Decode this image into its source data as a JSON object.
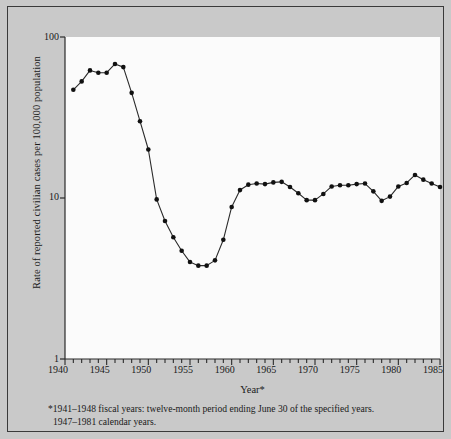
{
  "chart_data": {
    "type": "line",
    "title": "",
    "xlabel": "Year*",
    "ylabel": "Rate of reported civilian cases per 100,000 population",
    "yscale": "log",
    "ylim": [
      1,
      100
    ],
    "xlim": [
      1940,
      1985
    ],
    "grid": false,
    "legend": null,
    "marker": "filled-circle",
    "x": [
      1941,
      1942,
      1943,
      1944,
      1945,
      1946,
      1947,
      1948,
      1949,
      1950,
      1951,
      1952,
      1953,
      1954,
      1955,
      1956,
      1957,
      1958,
      1959,
      1960,
      1961,
      1962,
      1963,
      1964,
      1965,
      1966,
      1967,
      1968,
      1969,
      1970,
      1971,
      1972,
      1973,
      1974,
      1975,
      1976,
      1977,
      1978,
      1979,
      1980,
      1981,
      1982,
      1983,
      1984,
      1985
    ],
    "values": [
      47,
      53,
      62,
      60,
      60,
      68,
      65,
      45,
      30,
      20,
      9.8,
      7.2,
      5.7,
      4.7,
      4.0,
      3.8,
      3.8,
      4.1,
      5.5,
      8.8,
      11.2,
      12.1,
      12.3,
      12.2,
      12.5,
      12.6,
      11.7,
      10.7,
      9.7,
      9.7,
      10.6,
      11.8,
      12.0,
      12.0,
      12.2,
      12.3,
      11.0,
      9.6,
      10.2,
      11.8,
      12.4,
      13.9,
      13.0,
      12.3,
      11.7
    ],
    "xticks": [
      1940,
      1945,
      1950,
      1955,
      1960,
      1965,
      1970,
      1975,
      1980,
      1985
    ],
    "xtick_labels": [
      "1940",
      "1945",
      "1950",
      "1955",
      "1960",
      "1965",
      "1970",
      "1975",
      "1980",
      "1985"
    ],
    "yticks": [
      1,
      10,
      100
    ],
    "ytick_labels": [
      "1",
      "10",
      "100"
    ],
    "minor_xticks_step": 1,
    "line_color": "#2a2a2a",
    "marker_color": "#111111",
    "plot_background": "#fbfbfb",
    "figure_background": "#c9c9c9"
  },
  "footnote": {
    "line1": "*1941–1948 fiscal years:  twelve-month period ending June 30 of the specified years.",
    "line2": "1947–1981 calendar years."
  }
}
